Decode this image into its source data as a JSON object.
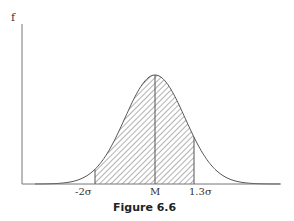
{
  "figure": {
    "caption": "Figure 6.6",
    "y_axis_label": "f",
    "tick_labels": {
      "left": "-2σ",
      "mean": "M",
      "right": "1.3σ"
    },
    "colors": {
      "line": "#555555",
      "hatch": "#666666",
      "background": "#ffffff"
    }
  },
  "chart_data": {
    "type": "area",
    "title": "Figure 6.6",
    "xlabel": "",
    "ylabel": "f",
    "x_ticks": [
      "-2σ",
      "M",
      "1.3σ"
    ],
    "x_tick_values_sigma": [
      -2,
      0,
      1.3
    ],
    "shaded_region": {
      "from_sigma": -2,
      "to_sigma": 1.3,
      "style": "diagonal hatch"
    },
    "mean_line": true,
    "grid": false
  }
}
